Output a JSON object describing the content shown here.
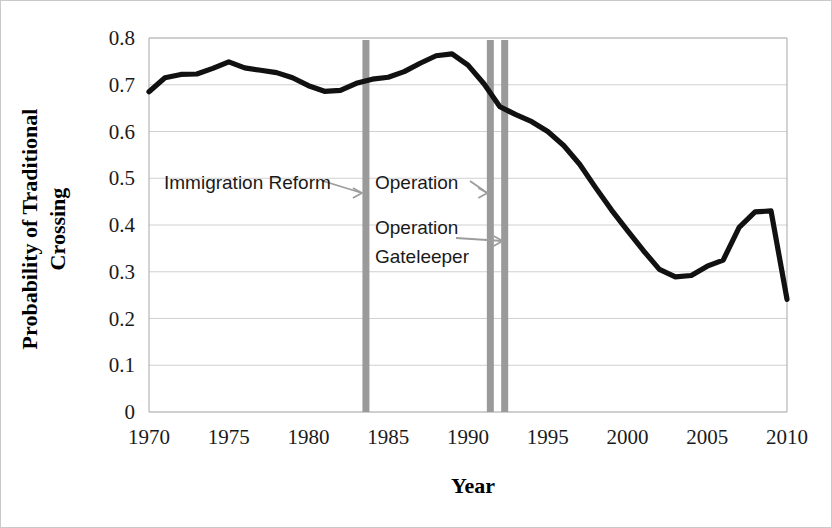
{
  "chart_data": {
    "type": "line",
    "title": "",
    "xlabel": "Year",
    "ylabel": "Probability of Traditional Crossing",
    "ylabel_line1": "Probability of Traditional",
    "ylabel_line2": "Crossing",
    "xlim": [
      1970,
      2010
    ],
    "ylim": [
      0,
      0.8
    ],
    "grid": true,
    "legend": "none",
    "xticks": [
      1970,
      1975,
      1980,
      1985,
      1990,
      1995,
      2000,
      2005,
      2010
    ],
    "xtick_labels": [
      "1970",
      "1975",
      "1980",
      "1985",
      "1990",
      "1995",
      "2000",
      "2005",
      "2010"
    ],
    "yticks": [
      0,
      0.1,
      0.2,
      0.3,
      0.4,
      0.5,
      0.6,
      0.7,
      0.8
    ],
    "ytick_labels": [
      "0",
      "0.1",
      "0.2",
      "0.3",
      "0.4",
      "0.5",
      "0.6",
      "0.7",
      "0.8"
    ],
    "x": [
      1970,
      1971,
      1972,
      1973,
      1974,
      1975,
      1976,
      1977,
      1978,
      1979,
      1980,
      1981,
      1982,
      1983,
      1984,
      1985,
      1986,
      1987,
      1988,
      1989,
      1990,
      1991,
      1992,
      1993,
      1994,
      1995,
      1996,
      1997,
      1998,
      1999,
      2000,
      2001,
      2002,
      2003,
      2004,
      2005,
      2006,
      2007,
      2008,
      2009,
      2010
    ],
    "values": [
      0.685,
      0.715,
      0.722,
      0.723,
      0.735,
      0.749,
      0.736,
      0.731,
      0.726,
      0.715,
      0.698,
      0.686,
      0.688,
      0.703,
      0.712,
      0.716,
      0.728,
      0.746,
      0.762,
      0.766,
      0.742,
      0.702,
      0.653,
      0.636,
      0.621,
      0.6,
      0.57,
      0.53,
      0.48,
      0.432,
      0.388,
      0.345,
      0.305,
      0.289,
      0.292,
      0.312,
      0.325,
      0.395,
      0.428,
      0.43,
      0.241
    ],
    "series": [
      {
        "name": "Probability of Traditional Crossing",
        "color": "#111111",
        "values": [
          0.685,
          0.715,
          0.722,
          0.723,
          0.735,
          0.749,
          0.736,
          0.731,
          0.726,
          0.715,
          0.698,
          0.686,
          0.688,
          0.703,
          0.712,
          0.716,
          0.728,
          0.746,
          0.762,
          0.766,
          0.742,
          0.702,
          0.653,
          0.636,
          0.621,
          0.6,
          0.57,
          0.53,
          0.48,
          0.432,
          0.388,
          0.345,
          0.305,
          0.289,
          0.292,
          0.312,
          0.325,
          0.395,
          0.428,
          0.43,
          0.241
        ]
      }
    ],
    "event_markers": [
      {
        "label": "Immigration Reform",
        "year": 1983.6,
        "color": "#9a9a9a"
      },
      {
        "label": "Operation",
        "year": 1991.4,
        "color": "#9a9a9a"
      },
      {
        "label": "Operation Gateleeper",
        "year": 1992.3,
        "color": "#9a9a9a"
      }
    ],
    "annotations": [
      {
        "text": "Immigration Reform",
        "x": 1971.3,
        "y": 0.498,
        "arrow_to_year": 1983.6
      },
      {
        "text": "Operation",
        "x": 1984.5,
        "y": 0.498,
        "arrow_to_year": 1991.4
      },
      {
        "text": "Operation",
        "x": 1984.5,
        "y": 0.408,
        "arrow_to_year": 1992.3
      },
      {
        "text": "Gateleeper",
        "x": 1984.5,
        "y": 0.35,
        "arrow_to_year": 1992.3
      }
    ]
  },
  "colors": {
    "line": "#111111",
    "event_bar": "#9a9a9a",
    "grid": "#d0d0d0",
    "axis": "#b5b5b5",
    "text": "#1a1a1a",
    "background": "#ffffff"
  },
  "labels": {
    "annotation_immigration_reform": "Immigration Reform",
    "annotation_operation_1": "Operation",
    "annotation_operation_2": "Operation",
    "annotation_gateleeper": "Gateleeper"
  }
}
